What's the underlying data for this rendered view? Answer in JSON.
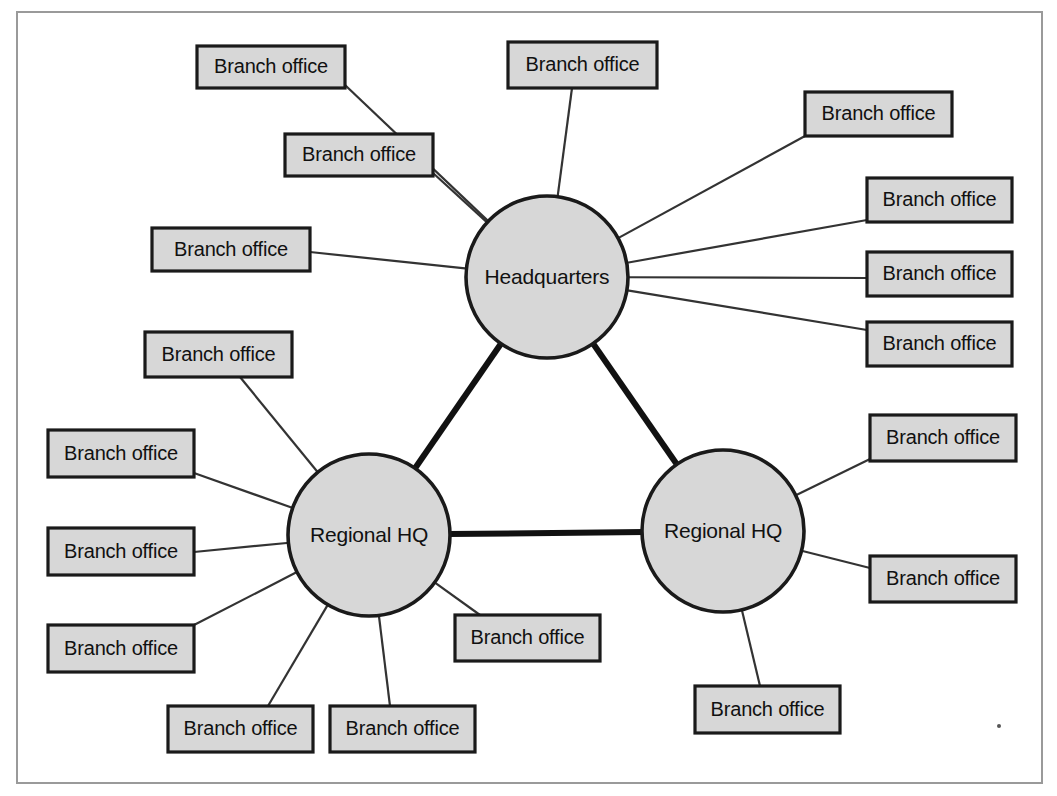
{
  "diagram": {
    "type": "network-topology",
    "colors": {
      "frame_border": "#9a9a9a",
      "shape_fill": "#d7d7d7",
      "shape_stroke": "#1a1a1a",
      "backbone_line": "#111111",
      "spoke_line": "#333333",
      "background": "#ffffff",
      "text": "#111111"
    },
    "frame": {
      "x": 17,
      "y": 12,
      "width": 1025,
      "height": 771
    },
    "core_nodes": [
      {
        "id": "hq",
        "label": "Headquarters",
        "cx": 547,
        "cy": 277,
        "r": 81
      },
      {
        "id": "regional-left",
        "label": "Regional HQ",
        "cx": 369,
        "cy": 535,
        "r": 81
      },
      {
        "id": "regional-right",
        "label": "Regional HQ",
        "cx": 723,
        "cy": 531,
        "r": 81
      }
    ],
    "backbone_links": [
      {
        "from": "hq",
        "to": "regional-left"
      },
      {
        "from": "hq",
        "to": "regional-right"
      },
      {
        "from": "regional-left",
        "to": "regional-right"
      }
    ],
    "branch_label": "Branch office",
    "branches": [
      {
        "id": "b01",
        "label": "Branch office",
        "x": 197,
        "y": 46,
        "w": 148,
        "h": 42,
        "parent": "hq",
        "anchor_x": 345,
        "anchor_y": 85
      },
      {
        "id": "b02",
        "label": "Branch office",
        "x": 285,
        "y": 134,
        "w": 148,
        "h": 42,
        "parent": "hq",
        "anchor_x": 433,
        "anchor_y": 173
      },
      {
        "id": "b03",
        "label": "Branch office",
        "x": 152,
        "y": 228,
        "w": 158,
        "h": 43,
        "parent": "hq",
        "anchor_x": 310,
        "anchor_y": 252
      },
      {
        "id": "b04",
        "label": "Branch office",
        "x": 508,
        "y": 42,
        "w": 149,
        "h": 46,
        "parent": "hq",
        "anchor_x": 572,
        "anchor_y": 88
      },
      {
        "id": "b05",
        "label": "Branch office",
        "x": 805,
        "y": 92,
        "w": 147,
        "h": 44,
        "parent": "hq",
        "anchor_x": 805,
        "anchor_y": 136
      },
      {
        "id": "b06",
        "label": "Branch office",
        "x": 867,
        "y": 178,
        "w": 145,
        "h": 44,
        "parent": "hq",
        "anchor_x": 867,
        "anchor_y": 220
      },
      {
        "id": "b07",
        "label": "Branch office",
        "x": 867,
        "y": 252,
        "w": 145,
        "h": 44,
        "parent": "hq",
        "anchor_x": 867,
        "anchor_y": 278
      },
      {
        "id": "b08",
        "label": "Branch office",
        "x": 867,
        "y": 322,
        "w": 145,
        "h": 44,
        "parent": "hq",
        "anchor_x": 867,
        "anchor_y": 330
      },
      {
        "id": "b09",
        "label": "Branch office",
        "x": 145,
        "y": 332,
        "w": 147,
        "h": 45,
        "parent": "regional-left",
        "anchor_x": 240,
        "anchor_y": 377
      },
      {
        "id": "b10",
        "label": "Branch office",
        "x": 48,
        "y": 430,
        "w": 146,
        "h": 47,
        "parent": "regional-left",
        "anchor_x": 194,
        "anchor_y": 473
      },
      {
        "id": "b11",
        "label": "Branch office",
        "x": 48,
        "y": 528,
        "w": 146,
        "h": 47,
        "parent": "regional-left",
        "anchor_x": 194,
        "anchor_y": 552
      },
      {
        "id": "b12",
        "label": "Branch office",
        "x": 48,
        "y": 625,
        "w": 146,
        "h": 47,
        "parent": "regional-left",
        "anchor_x": 194,
        "anchor_y": 625
      },
      {
        "id": "b13",
        "label": "Branch office",
        "x": 168,
        "y": 706,
        "w": 145,
        "h": 46,
        "parent": "regional-left",
        "anchor_x": 268,
        "anchor_y": 706
      },
      {
        "id": "b14",
        "label": "Branch office",
        "x": 330,
        "y": 706,
        "w": 145,
        "h": 46,
        "parent": "regional-left",
        "anchor_x": 390,
        "anchor_y": 706
      },
      {
        "id": "b15",
        "label": "Branch office",
        "x": 455,
        "y": 615,
        "w": 145,
        "h": 46,
        "parent": "regional-left",
        "anchor_x": 480,
        "anchor_y": 615
      },
      {
        "id": "b16",
        "label": "Branch office",
        "x": 870,
        "y": 415,
        "w": 146,
        "h": 46,
        "parent": "regional-right",
        "anchor_x": 870,
        "anchor_y": 459
      },
      {
        "id": "b17",
        "label": "Branch office",
        "x": 870,
        "y": 556,
        "w": 146,
        "h": 46,
        "parent": "regional-right",
        "anchor_x": 870,
        "anchor_y": 568
      },
      {
        "id": "b18",
        "label": "Branch office",
        "x": 695,
        "y": 686,
        "w": 145,
        "h": 47,
        "parent": "regional-right",
        "anchor_x": 760,
        "anchor_y": 686
      }
    ],
    "counts": {
      "core_nodes": 3,
      "branch_offices": 18,
      "hq_branches": 8,
      "regional_left_branches": 7,
      "regional_right_branches": 3
    }
  }
}
